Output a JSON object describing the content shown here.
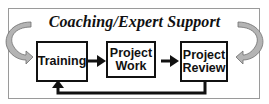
{
  "diagram": {
    "title": "Coaching/Expert Support",
    "nodes": [
      {
        "id": "training",
        "label_lines": [
          "Training"
        ]
      },
      {
        "id": "project-work",
        "label_lines": [
          "Project",
          "Work"
        ]
      },
      {
        "id": "project-review",
        "label_lines": [
          "Project",
          "Review"
        ]
      }
    ],
    "edges": [
      {
        "from": "training",
        "to": "project-work",
        "style": "solid-arrow"
      },
      {
        "from": "project-work",
        "to": "project-review",
        "style": "solid-arrow"
      },
      {
        "from": "project-review",
        "to": "training",
        "style": "feedback-loop"
      }
    ],
    "decorations": [
      {
        "name": "left-curved-arrow",
        "direction": "clockwise-into-diagram",
        "color": "#a8a8a8"
      },
      {
        "name": "right-curved-arrow",
        "direction": "counterclockwise-into-diagram",
        "color": "#a8a8a8"
      }
    ],
    "colors": {
      "frame_border": "#9a9a9a",
      "box_border": "#111111",
      "arrow": "#111111",
      "curved_arrow_fill": "#b4b4b4"
    }
  }
}
